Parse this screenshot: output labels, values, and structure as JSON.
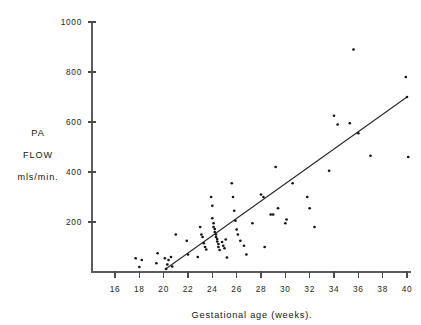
{
  "chart_data": {
    "type": "scatter",
    "title": "",
    "subtitle": "",
    "xlabel": "Gestational age (weeks).",
    "ylabel_lines": [
      "PA",
      "FLOW",
      "mls/min."
    ],
    "ylabel": "PA FLOW mls/min.",
    "xlim": [
      14,
      41
    ],
    "ylim": [
      0,
      1000
    ],
    "xticks": [
      16,
      18,
      20,
      22,
      24,
      26,
      28,
      30,
      32,
      34,
      36,
      38,
      40
    ],
    "yticks": [
      200,
      400,
      600,
      800,
      1000
    ],
    "xtick_labels": [
      "16",
      "18",
      "20",
      "22",
      "24",
      "26",
      "28",
      "30",
      "32",
      "34",
      "36",
      "38",
      "40"
    ],
    "ytick_labels": [
      "200",
      "400",
      "600",
      "800",
      "1000"
    ],
    "grid": false,
    "legend": null,
    "marker": "dot",
    "marker_color": "#151515",
    "axis_color": "#5b5b5b",
    "trendline": {
      "type": "linear-regression",
      "color": "#2a2a2a",
      "x_start": 20.1,
      "y_start": 10,
      "x_end": 40.0,
      "y_end": 700
    },
    "points": [
      [
        17.7,
        55
      ],
      [
        18.0,
        20
      ],
      [
        18.2,
        48
      ],
      [
        19.4,
        35
      ],
      [
        19.5,
        75
      ],
      [
        20.1,
        55
      ],
      [
        20.2,
        12
      ],
      [
        20.3,
        30
      ],
      [
        20.4,
        48
      ],
      [
        20.6,
        60
      ],
      [
        20.7,
        22
      ],
      [
        21.0,
        150
      ],
      [
        21.9,
        125
      ],
      [
        22.0,
        70
      ],
      [
        22.8,
        60
      ],
      [
        23.0,
        180
      ],
      [
        23.1,
        150
      ],
      [
        23.2,
        140
      ],
      [
        23.3,
        115
      ],
      [
        23.4,
        100
      ],
      [
        23.5,
        90
      ],
      [
        23.9,
        300
      ],
      [
        24.0,
        265
      ],
      [
        24.0,
        215
      ],
      [
        24.1,
        195
      ],
      [
        24.1,
        180
      ],
      [
        24.2,
        172
      ],
      [
        24.2,
        160
      ],
      [
        24.3,
        150
      ],
      [
        24.3,
        140
      ],
      [
        24.4,
        132
      ],
      [
        24.4,
        122
      ],
      [
        24.5,
        112
      ],
      [
        24.5,
        100
      ],
      [
        24.6,
        88
      ],
      [
        24.8,
        120
      ],
      [
        24.9,
        105
      ],
      [
        25.0,
        95
      ],
      [
        25.1,
        130
      ],
      [
        25.2,
        58
      ],
      [
        25.6,
        355
      ],
      [
        25.7,
        300
      ],
      [
        25.8,
        245
      ],
      [
        25.9,
        205
      ],
      [
        26.0,
        170
      ],
      [
        26.1,
        150
      ],
      [
        26.3,
        125
      ],
      [
        26.6,
        105
      ],
      [
        26.8,
        70
      ],
      [
        27.3,
        195
      ],
      [
        28.0,
        310
      ],
      [
        28.2,
        300
      ],
      [
        28.3,
        100
      ],
      [
        28.8,
        230
      ],
      [
        29.0,
        230
      ],
      [
        29.2,
        420
      ],
      [
        29.4,
        255
      ],
      [
        30.0,
        195
      ],
      [
        30.1,
        210
      ],
      [
        30.6,
        355
      ],
      [
        31.8,
        300
      ],
      [
        32.0,
        255
      ],
      [
        32.4,
        180
      ],
      [
        33.6,
        405
      ],
      [
        34.0,
        625
      ],
      [
        34.3,
        590
      ],
      [
        35.3,
        595
      ],
      [
        35.6,
        890
      ],
      [
        36.0,
        555
      ],
      [
        37.0,
        465
      ],
      [
        39.9,
        780
      ],
      [
        40.0,
        700
      ],
      [
        40.1,
        460
      ]
    ]
  }
}
